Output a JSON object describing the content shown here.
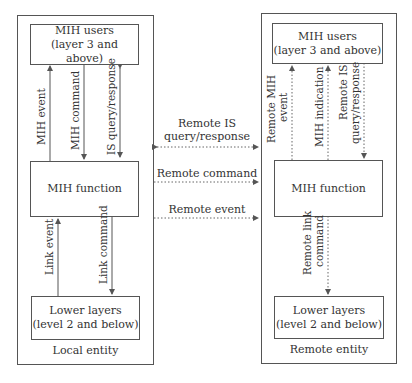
{
  "local_entity": {
    "caption": "Local entity",
    "mih_users": {
      "line1": "MIH users",
      "line2": "(layer 3 and above)"
    },
    "mih_function": {
      "label": "MIH function"
    },
    "lower_layers": {
      "line1": "Lower layers",
      "line2": "(level 2 and below)"
    },
    "arrows": {
      "mih_event": "MIH event",
      "mih_command": "MIH command",
      "is_query": "IS query/response",
      "link_event": "Link event",
      "link_command": "Link command"
    }
  },
  "remote_entity": {
    "caption": "Remote entity",
    "mih_users": {
      "line1": "MIH users",
      "line2": "(layer 3 and above)"
    },
    "mih_function": {
      "label": "MIH function"
    },
    "lower_layers": {
      "line1": "Lower layers",
      "line2": "(level 2 and below)"
    },
    "arrows": {
      "remote_mih_event_1": "Remote MIH",
      "remote_mih_event_2": "event",
      "mih_indication": "MIH indication",
      "remote_is_1": "Remote IS",
      "remote_is_2": "query/response",
      "remote_link_1": "Remote link",
      "remote_link_2": "command"
    }
  },
  "between": {
    "remote_is_1": "Remote IS",
    "remote_is_2": "query/response",
    "remote_command": "Remote command",
    "remote_event": "Remote event"
  },
  "colors": {
    "line": "#555555",
    "text": "#333333",
    "background": "#ffffff"
  }
}
